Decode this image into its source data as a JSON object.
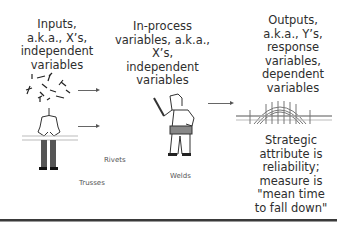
{
  "columns": {
    "inputs": {
      "text": "Inputs,\na.k.a., X’s,\nindependent\nvariables"
    },
    "in_process": {
      "text": "In-process\nvariables, a.k.a.,\nX’s,\nindependent\nvariables"
    },
    "outputs": {
      "text": "Outputs,\na.k.a., Y’s,\nresponse\nvariables,\ndependent\nvariables"
    }
  },
  "annotations": {
    "rivets": "Rivets",
    "trusses": "Trusses",
    "welds": "Welds"
  },
  "strategic_note": "Strategic\nattribute is\nreliability;\nmeasure is\n\"mean time\nto fall down\"",
  "icons": {
    "inputs_figure": "person-with-parts-icon",
    "process_figure": "worker-with-tool-icon",
    "output_figure": "arch-bridge-icon"
  },
  "colors": {
    "text": "#2e2e2e",
    "line": "#666666",
    "bar": "#3a3a3a"
  }
}
